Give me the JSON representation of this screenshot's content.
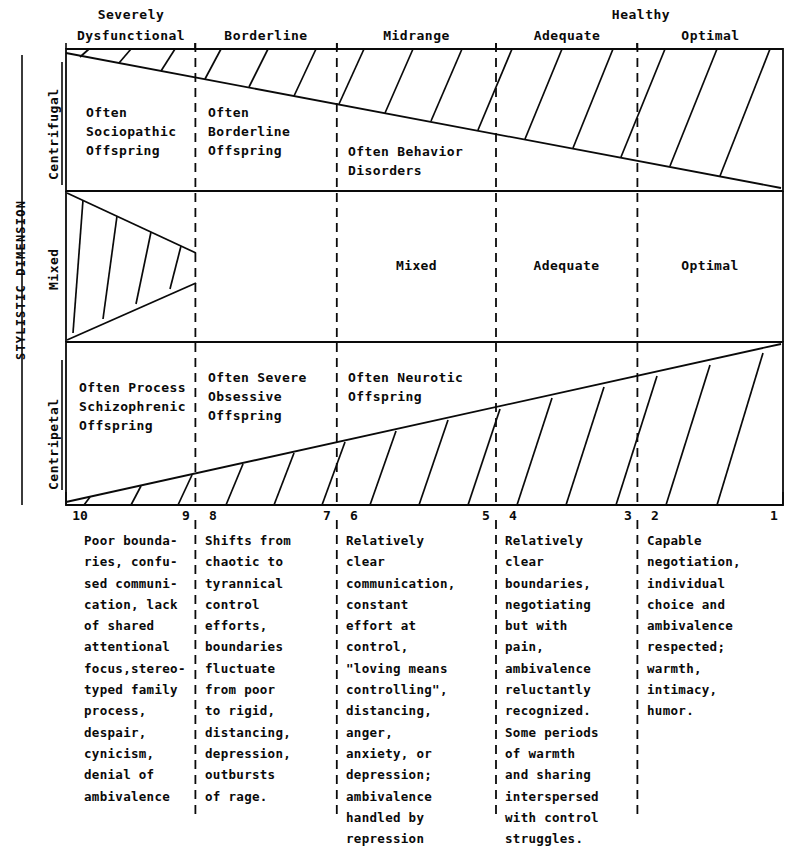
{
  "figure": {
    "vertical_axis_label": "STYLISTIC DIMENSION",
    "health_group_label": "Healthy"
  },
  "columns": [
    {
      "header": "Severely\nDysfunctional",
      "header_line1": "Severely",
      "header_line2": "Dysfunctional"
    },
    {
      "header": "Borderline",
      "header_line1": "",
      "header_line2": "Borderline"
    },
    {
      "header": "Midrange",
      "header_line1": "",
      "header_line2": "Midrange"
    },
    {
      "header": "Adequate",
      "header_line1": "",
      "header_line2": "Adequate"
    },
    {
      "header": "Optimal",
      "header_line1": "",
      "header_line2": "Optimal"
    }
  ],
  "rows": [
    {
      "label": "Centrifugal"
    },
    {
      "label": "Mixed"
    },
    {
      "label": "Centripetal"
    }
  ],
  "grid_cells": {
    "centrifugal": [
      "Often\nSociopathic\nOffspring",
      "Often\nBorderline\nOffspring",
      "Often Behavior\nDisorders",
      "",
      ""
    ],
    "mixed": [
      "",
      "",
      "Mixed",
      "Adequate",
      "Optimal"
    ],
    "centripetal": [
      "Often Process\nSchizophrenic\nOffspring",
      "Often Severe\nObsessive\nOffspring",
      "Often Neurotic\nOffspring",
      "",
      ""
    ]
  },
  "scale": {
    "ticks": [
      "10",
      "9",
      "8",
      "7",
      "6",
      "5",
      "4",
      "3",
      "2",
      "1"
    ]
  },
  "descriptions": [
    "Poor bounda-\nries, confu-\nsed communi-\ncation, lack\nof shared\nattentional\nfocus,stereo-\ntyped family\nprocess,\ndespair,\ncynicism,\ndenial of\nambivalence",
    "Shifts from\nchaotic to\ntyrannical\ncontrol\nefforts,\nboundaries\nfluctuate\nfrom poor\nto rigid,\ndistancing,\ndepression,\noutbursts\nof rage.",
    "Relatively\nclear\ncommunication,\nconstant\neffort at\ncontrol,\n\"loving means\ncontrolling\",\ndistancing,\nanger,\nanxiety, or\ndepression;\nambivalence\nhandled by\nrepression",
    "Relatively\nclear\nboundaries,\nnegotiating\nbut with\npain,\nambivalence\nreluctantly\nrecognized.\nSome periods\nof warmth\nand sharing\ninterspersed\nwith control\nstruggles.",
    "Capable\nnegotiation,\nindividual\nchoice and\nambivalence\nrespected;\nwarmth,\nintimacy,\nhumor."
  ],
  "colors": {
    "ink": "#0a0a0a",
    "background": "#ffffff"
  }
}
